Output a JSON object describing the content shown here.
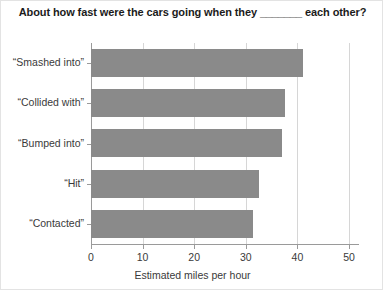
{
  "chart_data": {
    "type": "bar",
    "orientation": "horizontal",
    "title": "About how fast were the cars going when they _______ each other?",
    "xlabel": "Estimated miles per hour",
    "ylabel": "",
    "categories": [
      "“Smashed into”",
      "“Collided with”",
      "“Bumped into”",
      "“Hit”",
      "“Contacted”"
    ],
    "values": [
      41.0,
      37.6,
      37.0,
      32.6,
      31.3
    ],
    "xlim": [
      0,
      50
    ],
    "xticks": [
      0,
      10,
      20,
      30,
      40,
      50
    ],
    "xtick_labels": [
      "0",
      "10",
      "20",
      "30",
      "40",
      "50"
    ],
    "grid": "vertical",
    "legend": null,
    "bar_color": "#8a8a8a",
    "axis_color": "#9a9a9a",
    "grid_color": "#d6d6d6",
    "text_color": "#3a3a3a",
    "title_color": "#1b1b1b"
  }
}
